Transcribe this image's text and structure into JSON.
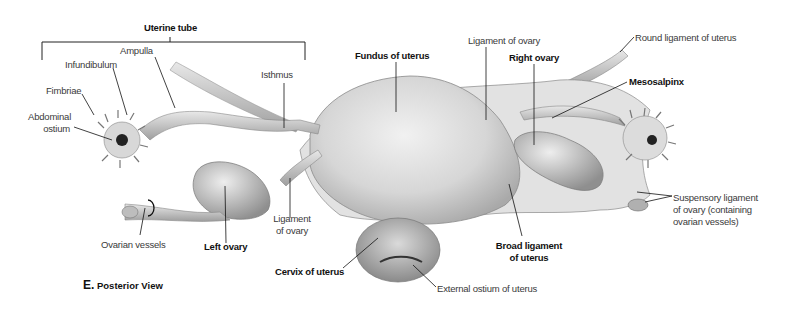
{
  "figure": {
    "view_letter": "E.",
    "view_title": "Posterior View"
  },
  "labels": {
    "uterine_tube": "Uterine tube",
    "ampulla": "Ampulla",
    "infundibulum": "Infundibulum",
    "fimbriae": "Fimbriae",
    "abdominal_ostium_1": "Abdominal",
    "abdominal_ostium_2": "ostium",
    "isthmus": "Isthmus",
    "fundus": "Fundus of uterus",
    "ligament_ovary_right": "Ligament of ovary",
    "right_ovary": "Right ovary",
    "round_ligament": "Round ligament of uterus",
    "mesosalpinx": "Mesosalpinx",
    "ovarian_vessels": "Ovarian vessels",
    "left_ovary": "Left ovary",
    "ligament_ovary_left_1": "Ligament",
    "ligament_ovary_left_2": "of ovary",
    "cervix": "Cervix of uterus",
    "broad_ligament_1": "Broad ligament",
    "broad_ligament_2": "of uterus",
    "external_ostium": "External ostium of uterus",
    "suspensory_1": "Suspensory ligament",
    "suspensory_2": "of ovary (containing",
    "suspensory_3": "ovarian vessels)"
  }
}
